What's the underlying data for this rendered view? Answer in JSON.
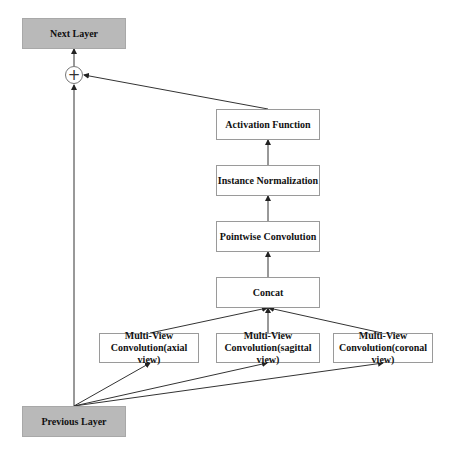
{
  "diagram": {
    "nodes": {
      "next_layer": "Next Layer",
      "add_operator": "+",
      "activation": "Activation Function",
      "instance_norm": "Instance Normalization",
      "pointwise": "Pointwise Convolution",
      "concat": "Concat",
      "mv_axial": {
        "line1": "Multi-View",
        "line2": "Convolution(axial view)"
      },
      "mv_sagittal": {
        "line1": "Multi-View",
        "line2": "Convolution(sagittal view)"
      },
      "mv_coronal": {
        "line1": "Multi-View",
        "line2": "Convolution(coronal view)"
      },
      "previous_layer": "Previous Layer"
    },
    "colors": {
      "io_fill": "#b9b9b9",
      "box_border": "#9a9a9a",
      "arrow": "#222222"
    },
    "edges": [
      [
        "previous_layer",
        "add_operator"
      ],
      [
        "previous_layer",
        "mv_axial"
      ],
      [
        "previous_layer",
        "mv_sagittal"
      ],
      [
        "previous_layer",
        "mv_coronal"
      ],
      [
        "mv_axial",
        "concat"
      ],
      [
        "mv_sagittal",
        "concat"
      ],
      [
        "mv_coronal",
        "concat"
      ],
      [
        "concat",
        "pointwise"
      ],
      [
        "pointwise",
        "instance_norm"
      ],
      [
        "instance_norm",
        "activation"
      ],
      [
        "activation",
        "add_operator"
      ],
      [
        "add_operator",
        "next_layer"
      ]
    ]
  }
}
